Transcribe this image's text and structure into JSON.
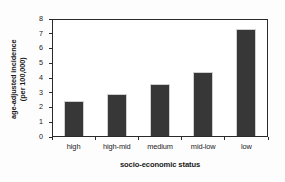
{
  "chart_data": {
    "type": "bar",
    "title": "",
    "categories": [
      "high",
      "high-mid",
      "medium",
      "mid-low",
      "low"
    ],
    "values": [
      2.4,
      2.9,
      3.6,
      4.4,
      7.4
    ],
    "xlabel": "socio-economic status",
    "ylabel_line1": "age-adjusted incidence",
    "ylabel_line2": "(per 100,000)",
    "ylim": [
      0,
      8
    ],
    "yticks": [
      0,
      1,
      2,
      3,
      4,
      5,
      6,
      7,
      8
    ],
    "ytick_labels": [
      "0",
      "1",
      "2",
      "3",
      "4",
      "5",
      "6",
      "7",
      "8"
    ],
    "grid": false,
    "legend": null,
    "bar_color": "#373737",
    "bar_edge_color": "#cfcfcf",
    "frame_color": "#2b2b2b",
    "plot_background": "#ffffff",
    "figure_background": "#fdfdfd"
  }
}
